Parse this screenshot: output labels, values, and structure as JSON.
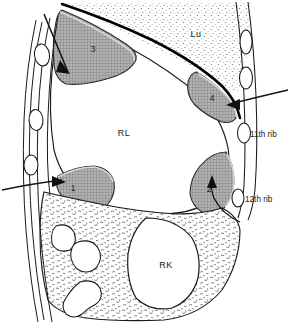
{
  "figure": {
    "type": "anatomical-line-diagram"
  },
  "organ_labels": {
    "liver": "RL",
    "lung": "Lu",
    "kidney": "RK"
  },
  "rib_labels": {
    "eleventh": "11th rib",
    "twelfth": "12th rib"
  },
  "region_numbers": {
    "one": "1",
    "two": "2",
    "three": "3",
    "four": "4"
  },
  "colors": {
    "outline": "#1a1a1a",
    "shaded_fill": "#9d9d9d",
    "stipple": "#555555",
    "background": "#ffffff",
    "diaphragm": "#000000"
  }
}
